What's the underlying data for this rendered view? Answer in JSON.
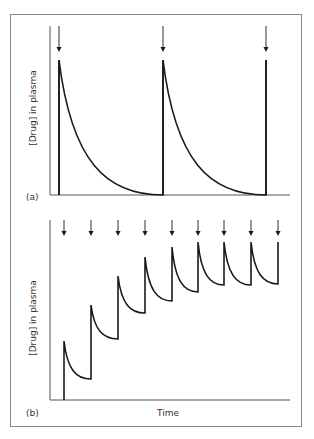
{
  "chart_data": [
    {
      "type": "line",
      "panel": "(a)",
      "title": "",
      "xlabel": "",
      "ylabel": "[Drug] in plasma",
      "grid": false,
      "description": "Single doses at long intervals; concentration decays exponentially to ~zero before next dose",
      "dose_times": [
        0,
        1,
        2
      ],
      "series": [
        {
          "name": "plasma concentration",
          "points": [
            {
              "t": 0,
              "c": 0
            },
            {
              "t": 0,
              "c": 1.0
            },
            {
              "t": 0.25,
              "c": 0.45
            },
            {
              "t": 0.5,
              "c": 0.18
            },
            {
              "t": 0.75,
              "c": 0.05
            },
            {
              "t": 1,
              "c": 0
            },
            {
              "t": 1,
              "c": 1.0
            },
            {
              "t": 1.25,
              "c": 0.45
            },
            {
              "t": 1.5,
              "c": 0.18
            },
            {
              "t": 1.75,
              "c": 0.05
            },
            {
              "t": 2,
              "c": 0
            },
            {
              "t": 2,
              "c": 1.0
            }
          ]
        }
      ],
      "peaks": [
        1.0,
        1.0,
        1.0
      ],
      "troughs": [
        0,
        0
      ]
    },
    {
      "type": "line",
      "panel": "(b)",
      "title": "",
      "xlabel": "Time",
      "ylabel": "[Drug] in plasma",
      "grid": false,
      "description": "Repeated doses at short intervals; concentration accumulates to a steady state",
      "dose_times": [
        0,
        1,
        2,
        3,
        4,
        5,
        6,
        7,
        8
      ],
      "peaks": [
        0.36,
        0.55,
        0.69,
        0.79,
        0.84,
        0.86,
        0.86,
        0.86,
        0.86
      ],
      "troughs": [
        0.12,
        0.34,
        0.5,
        0.58,
        0.62,
        0.66,
        0.66,
        0.66
      ]
    }
  ],
  "figure": {
    "panel_a": {
      "label": "(a)",
      "ylabel": "[Drug] in plasma",
      "axis": {
        "x0": 50,
        "y0": 195,
        "ytop": 26,
        "xend": 290
      },
      "dose_x": [
        59,
        163,
        266
      ],
      "peak_y": [
        60,
        60,
        60
      ],
      "trough_y": [
        195,
        195
      ],
      "arrow_top": 26,
      "arrow_tip": 52
    },
    "panel_b": {
      "label": "(b)",
      "ylabel": "[Drug] in plasma",
      "xlabel": "Time",
      "axis": {
        "x0": 50,
        "y0": 400,
        "ytop": 220,
        "xend": 290
      },
      "dose_x": [
        64,
        91,
        118,
        145,
        172,
        198,
        224,
        251,
        278
      ],
      "peak_y": [
        341,
        305,
        276,
        257,
        247,
        242,
        242,
        242,
        242
      ],
      "trough_y": [
        379,
        339,
        313,
        301,
        292,
        285,
        285,
        284
      ],
      "arrow_top": 220,
      "arrow_tip": 236
    },
    "caption_visible": "",
    "colors": {
      "line": "#1a1a1a",
      "axis": "#555555",
      "frame": "#8a8a8a",
      "text": "#333333"
    }
  }
}
